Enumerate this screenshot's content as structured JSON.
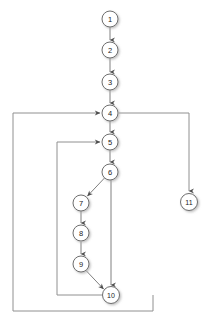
{
  "diagram": {
    "type": "directed-graph",
    "canvas": {
      "width": 208,
      "height": 328,
      "background": "#ffffff"
    },
    "style": {
      "node_fill": "#ffffff",
      "node_stroke": "#6e6e6e",
      "node_radius": 7.5,
      "edge_color": "#808080",
      "routed_edge_color": "#909090",
      "label_color": "#1a1a1a",
      "shadow_color": "#c9c9c9"
    },
    "nodes": [
      {
        "id": "1",
        "label": "1",
        "cx": 110,
        "cy": 19
      },
      {
        "id": "2",
        "label": "2",
        "cx": 110,
        "cy": 50
      },
      {
        "id": "3",
        "label": "3",
        "cx": 110,
        "cy": 82
      },
      {
        "id": "4",
        "label": "4",
        "cx": 110,
        "cy": 113
      },
      {
        "id": "5",
        "label": "5",
        "cx": 110,
        "cy": 142
      },
      {
        "id": "6",
        "label": "6",
        "cx": 110,
        "cy": 172
      },
      {
        "id": "7",
        "label": "7",
        "cx": 81,
        "cy": 203
      },
      {
        "id": "8",
        "label": "8",
        "cx": 81,
        "cy": 233
      },
      {
        "id": "9",
        "label": "9",
        "cx": 81,
        "cy": 264
      },
      {
        "id": "10",
        "label": "10",
        "cx": 111,
        "cy": 295
      },
      {
        "id": "11",
        "label": "11",
        "cx": 189,
        "cy": 202
      }
    ],
    "edges": [
      {
        "from": "1",
        "to": "2",
        "kind": "straight",
        "path": "M 110 27.5 L 110 41"
      },
      {
        "from": "2",
        "to": "3",
        "kind": "straight",
        "path": "M 110 58.5 L 110 73"
      },
      {
        "from": "3",
        "to": "4",
        "kind": "straight",
        "path": "M 110 90.5 L 110 104"
      },
      {
        "from": "4",
        "to": "5",
        "kind": "straight",
        "path": "M 110 121.5 L 110 133"
      },
      {
        "from": "5",
        "to": "6",
        "kind": "straight",
        "path": "M 110 150.5 L 110 163"
      },
      {
        "from": "6",
        "to": "7",
        "kind": "diagonal",
        "path": "M 105 178.5 L 87 197"
      },
      {
        "from": "6",
        "to": "10",
        "kind": "straight",
        "path": "M 111 180.5 L 111 286"
      },
      {
        "from": "7",
        "to": "8",
        "kind": "straight",
        "path": "M 81 211.5 L 81 224"
      },
      {
        "from": "8",
        "to": "9",
        "kind": "straight",
        "path": "M 81 241.5 L 81 255"
      },
      {
        "from": "9",
        "to": "10",
        "kind": "diagonal",
        "path": "M 87 270 L 104 290"
      },
      {
        "from": "10",
        "to": "5",
        "kind": "back-edge-routed",
        "path": "M 103 295 L 57 295 L 57 142 L 101 142"
      },
      {
        "from": "10",
        "to": "4",
        "kind": "back-edge-routed",
        "path": "M 153 295 L 153 311 L 13 311 L 13 113 L 101 113"
      },
      {
        "from": "4",
        "to": "11",
        "kind": "branch-routed",
        "path": "M 119 113 L 189 113 L 189 192"
      }
    ],
    "arrowheads": [
      {
        "at_node": "2",
        "x": 110,
        "y": 42,
        "dir": "down"
      },
      {
        "at_node": "3",
        "x": 110,
        "y": 74,
        "dir": "down"
      },
      {
        "at_node": "4",
        "x": 110,
        "y": 105,
        "dir": "down"
      },
      {
        "at_node": "5",
        "x": 110,
        "y": 134,
        "dir": "down"
      },
      {
        "at_node": "6",
        "x": 110,
        "y": 164,
        "dir": "down"
      },
      {
        "at_node": "7",
        "x": 87,
        "y": 196,
        "dir": "diagonal-down-left"
      },
      {
        "at_node": "8",
        "x": 81,
        "y": 225,
        "dir": "down"
      },
      {
        "at_node": "9",
        "x": 81,
        "y": 256,
        "dir": "down"
      },
      {
        "at_node": "10",
        "x": 111,
        "y": 287,
        "dir": "down"
      },
      {
        "at_node": "10",
        "x": 104,
        "y": 289,
        "dir": "diagonal-down-right"
      },
      {
        "at_node": "5",
        "x": 102,
        "y": 142,
        "dir": "right"
      },
      {
        "at_node": "4",
        "x": 102,
        "y": 113,
        "dir": "right"
      },
      {
        "at_node": "11",
        "x": 189,
        "y": 193,
        "dir": "down"
      }
    ]
  }
}
